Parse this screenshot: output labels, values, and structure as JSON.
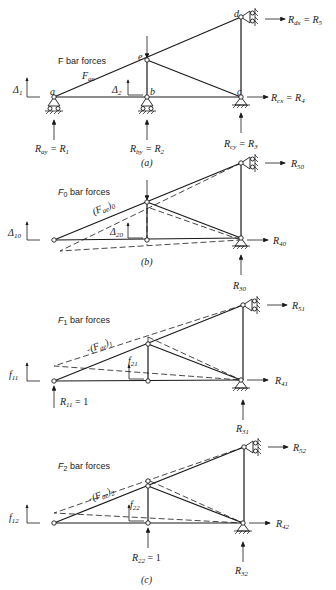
{
  "panel_a": {
    "title": "F bar forces",
    "caption": "(a)",
    "member_label": "F",
    "member_sub": "ae",
    "nodes": {
      "a": "a",
      "b": "b",
      "c": "c",
      "d": "d",
      "e": "e"
    },
    "delta1": "Δ",
    "delta1_sub": "1",
    "delta2": "Δ",
    "delta2_sub": "2",
    "reactions": {
      "ray": "R",
      "ray_sub": "ay",
      "ray_eq": " = R",
      "ray_eq_sub": "1",
      "rby": "R",
      "rby_sub": "by",
      "rby_eq": " = R",
      "rby_eq_sub": "2",
      "rcy": "R",
      "rcy_sub": "cy",
      "rcy_eq": " = R",
      "rcy_eq_sub": "3",
      "rcx": "R",
      "rcx_sub": "cx",
      "rcx_eq": " = R",
      "rcx_eq_sub": "4",
      "rdx": "R",
      "rdx_sub": "dx",
      "rdx_eq": " = R",
      "rdx_eq_sub": "5"
    }
  },
  "panel_b": {
    "title_main": "F",
    "title_sub": "0",
    "title_rest": " bar forces",
    "caption": "(b)",
    "member_label": "(F",
    "member_sub": "ae",
    "member_close": ")",
    "member_close_sub": "0",
    "delta10": "Δ",
    "delta10_sub": "10",
    "delta20": "Δ",
    "delta20_sub": "20",
    "r50": "R",
    "r50_sub": "50",
    "r40": "R",
    "r40_sub": "40",
    "r30": "R",
    "r30_sub": "30"
  },
  "panel_c1": {
    "title_main": "F",
    "title_sub": "1",
    "title_rest": " bar forces",
    "member_label": "(F",
    "member_sub": "ae",
    "member_close": ")",
    "member_close_sub": "1",
    "f11": "f",
    "f11_sub": "11",
    "f21": "f",
    "f21_sub": "21",
    "r51": "R",
    "r51_sub": "51",
    "r41": "R",
    "r41_sub": "41",
    "r31": "R",
    "r31_sub": "31",
    "r11": "R",
    "r11_sub": "11",
    "r11_eq": " = 1"
  },
  "panel_c2": {
    "title_main": "F",
    "title_sub": "2",
    "title_rest": " bar forces",
    "caption": "(c)",
    "member_label": "(F",
    "member_sub": "ae",
    "member_close": ")",
    "member_close_sub": "2",
    "f12": "f",
    "f12_sub": "12",
    "f22": "f",
    "f22_sub": "22",
    "r52": "R",
    "r52_sub": "52",
    "r42": "R",
    "r42_sub": "42",
    "r32": "R",
    "r32_sub": "32",
    "r22": "R",
    "r22_sub": "22",
    "r22_eq": " = 1"
  }
}
